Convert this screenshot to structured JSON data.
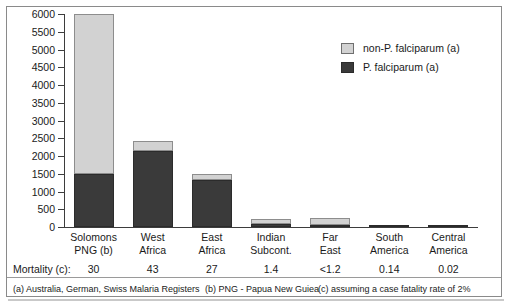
{
  "chart_data": {
    "type": "bar",
    "stacked": true,
    "title": "",
    "subtitle": "",
    "xlabel": "",
    "ylabel": "",
    "ylim": [
      0,
      6000
    ],
    "yticks": [
      0,
      500,
      1000,
      1500,
      2000,
      2500,
      3000,
      3500,
      4000,
      4500,
      5000,
      5500,
      6000
    ],
    "ytick_labels": [
      "0",
      "500",
      "1000",
      "1500",
      "2000",
      "2500",
      "3000",
      "3500",
      "4000",
      "4500",
      "5000",
      "5500",
      "6000"
    ],
    "grid": false,
    "legend_position": "upper-right",
    "categories": [
      "Solomons PNG (b)",
      "West Africa",
      "East Africa",
      "Indian Subcont.",
      "Far East",
      "South America",
      "Central America"
    ],
    "category_lines": [
      [
        "Solomons",
        "PNG (b)"
      ],
      [
        "West",
        "Africa"
      ],
      [
        "East",
        "Africa"
      ],
      [
        "Indian",
        "Subcont."
      ],
      [
        "Far",
        "East"
      ],
      [
        "South",
        "America"
      ],
      [
        "Central",
        "America"
      ]
    ],
    "series": [
      {
        "name": "P. falciparum (a)",
        "color": "#3a3a3a",
        "values": [
          1500,
          2150,
          1330,
          90,
          60,
          30,
          20
        ]
      },
      {
        "name": "non-P. falciparum (a)",
        "color": "#d2d2d2",
        "values": [
          4500,
          270,
          170,
          140,
          190,
          0,
          0
        ]
      }
    ],
    "totals": [
      6000,
      2420,
      1500,
      230,
      250,
      30,
      20
    ],
    "annotations": {
      "mortality_row_label": "Mortality (c):",
      "mortality_values": [
        "30",
        "43",
        "27",
        "1.4",
        "<1.2",
        "0.14",
        "0.02"
      ]
    }
  },
  "legend": {
    "items": [
      {
        "label": "non-P. falciparum (a)",
        "swatch": "light"
      },
      {
        "label": "P. falciparum (a)",
        "swatch": "dark"
      }
    ]
  },
  "footnotes": {
    "a": "(a) Australia, German, Swiss Malaria Registers",
    "b": "(b) PNG - Papua New Guiea",
    "c": "(c) assuming a case fatality rate of 2%"
  },
  "colors": {
    "dark_series": "#3a3a3a",
    "light_series": "#d2d2d2",
    "axis": "#3d3d3d",
    "frame": "#8a8a8a",
    "text": "#1a1a1a"
  }
}
